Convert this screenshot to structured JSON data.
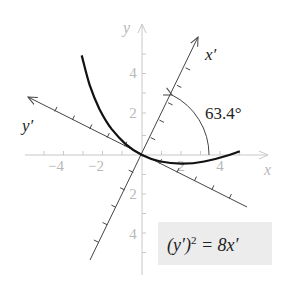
{
  "figure": {
    "equation": "(y′)² = 8x′",
    "equation_parts": {
      "lhs_base": "(y′)",
      "exponent": "2",
      "rhs": " = 8x′"
    },
    "angle_label": "63.4°",
    "axes": {
      "x_label": "x",
      "y_label": "y",
      "x_prime_label": "x′",
      "y_prime_label": "y′",
      "x_ticks": [
        "−4",
        "−2",
        "2",
        "4"
      ],
      "y_ticks": [
        "4",
        "2",
        "2",
        "4"
      ]
    },
    "colors": {
      "original_axes": "#c8c8c8",
      "rotated_axes": "#444444",
      "curve": "#111111",
      "equation_box": "#ececec"
    }
  }
}
